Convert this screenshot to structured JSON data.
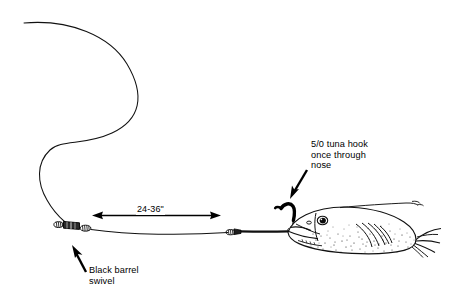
{
  "figure": {
    "background_color": "#ffffff",
    "ink_color": "#000000",
    "width": 449,
    "height": 302
  },
  "callouts": {
    "hook": {
      "lines": [
        "5/0 tuna hook",
        "once through",
        "nose"
      ],
      "text": "5/0 tuna hook\nonce through\nnose",
      "arrow_name": "hook-callout-arrow"
    },
    "swivel": {
      "lines": [
        "Black barrel",
        "swivel"
      ],
      "text": "Black barrel\nswivel",
      "arrow_name": "swivel-callout-arrow"
    }
  },
  "dimension": {
    "label": "24-36\"",
    "arrow_name": "leader-dimension-arrow"
  },
  "parts": {
    "main_line": "main-line",
    "barrel_swivel": "black-barrel-swivel",
    "leader_line": "leader-line",
    "crimp_knot": "leader-crimp-knot",
    "hook": "tuna-hook",
    "baitfish": "baitfish-body"
  }
}
